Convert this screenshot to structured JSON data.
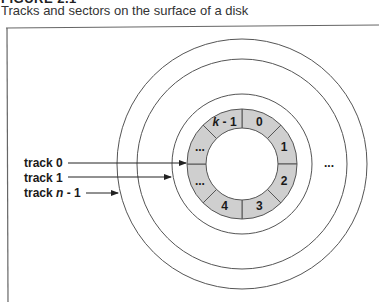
{
  "figure": {
    "label": "FIGURE 2.1",
    "caption": "Tracks and sectors on the surface of a disk"
  },
  "disk": {
    "ring_fill": "#cfcfcf",
    "line_color": "#555555",
    "sectors": [
      "0",
      "1",
      "2",
      "3",
      "4",
      "...",
      "...",
      "k - 1"
    ],
    "outer_ellipsis": "..."
  },
  "tracks": [
    {
      "prefix": "track ",
      "index": "0",
      "italic": false
    },
    {
      "prefix": "track ",
      "index": "1",
      "italic": false
    },
    {
      "prefix": "track ",
      "index_var": "n",
      "suffix": " - 1",
      "italic": true
    }
  ]
}
